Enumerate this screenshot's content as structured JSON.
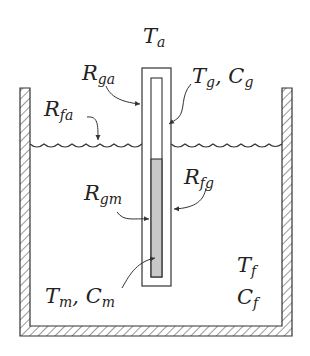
{
  "diagram": {
    "type": "thermometer-in-fluid-bath thermal model",
    "colors": {
      "line": "#333333",
      "mercury_fill": "#c8c8c8",
      "background": "#ffffff"
    },
    "labels": {
      "ambient": {
        "main": "T",
        "sub": "a"
      },
      "r_ga": {
        "main": "R",
        "sub": "ga"
      },
      "glass": {
        "main": "T",
        "sub1": "g",
        "sep": ", ",
        "main2": "C",
        "sub2": "g"
      },
      "r_fa": {
        "main": "R",
        "sub": "fa"
      },
      "r_gm": {
        "main": "R",
        "sub": "gm"
      },
      "r_fg": {
        "main": "R",
        "sub": "fg"
      },
      "mercury": {
        "main": "T",
        "sub1": "m",
        "sep": ", ",
        "main2": "C",
        "sub2": "m"
      },
      "fluid_t": {
        "main": "T",
        "sub": "f"
      },
      "fluid_c": {
        "main": "C",
        "sub": "f"
      }
    },
    "components": [
      {
        "name": "container",
        "description": "hatched insulated vessel walls and floor"
      },
      {
        "name": "fluid-surface",
        "description": "wavy free surface of the fluid"
      },
      {
        "name": "glass-tube",
        "description": "outer glass thermometer body"
      },
      {
        "name": "mercury-column",
        "description": "inner bore, lower part filled grey"
      }
    ]
  }
}
